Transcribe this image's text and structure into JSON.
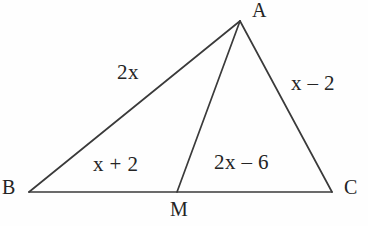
{
  "figure": {
    "width": 368,
    "height": 226,
    "background_color": "#fefefe",
    "stroke_color": "#3a3a3a",
    "stroke_width": 1.7,
    "text_color": "#242424"
  },
  "vertices": {
    "A": {
      "label": "A",
      "x": 240,
      "y": 21
    },
    "B": {
      "label": "B",
      "x": 29,
      "y": 192
    },
    "C": {
      "label": "C",
      "x": 332,
      "y": 192
    },
    "M": {
      "label": "M",
      "x": 177,
      "y": 192
    }
  },
  "segments": [
    {
      "name": "AB",
      "from": "B",
      "to": "A"
    },
    {
      "name": "AC",
      "from": "A",
      "to": "C"
    },
    {
      "name": "BC",
      "from": "B",
      "to": "C"
    },
    {
      "name": "AM",
      "from": "A",
      "to": "M"
    }
  ],
  "edge_labels": {
    "AB": "2x",
    "AC": "x – 2",
    "BM": "x + 2",
    "MC": "2x – 6"
  }
}
